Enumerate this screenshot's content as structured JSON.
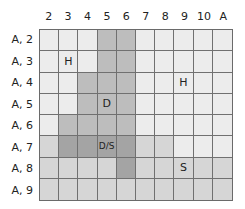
{
  "columns": [
    "2",
    "3",
    "4",
    "5",
    "6",
    "7",
    "8",
    "9",
    "10",
    "A"
  ],
  "rows": [
    "A, 2",
    "A, 3",
    "A, 4",
    "A, 5",
    "A, 6",
    "A, 7",
    "A, 8",
    "A, 9"
  ],
  "shade_levels": {
    "0": "#ececec",
    "1": "#d6d6d6",
    "2": "#bdbdbd",
    "3": "#a4a4a4"
  },
  "cells": [
    [
      0,
      0,
      0,
      2,
      2,
      0,
      0,
      0,
      0,
      0
    ],
    [
      0,
      0,
      0,
      2,
      2,
      0,
      0,
      0,
      0,
      0
    ],
    [
      0,
      0,
      2,
      2,
      2,
      0,
      0,
      0,
      0,
      0
    ],
    [
      0,
      0,
      2,
      2,
      2,
      0,
      0,
      0,
      0,
      0
    ],
    [
      0,
      2,
      2,
      2,
      2,
      0,
      0,
      0,
      0,
      0
    ],
    [
      1,
      3,
      3,
      3,
      3,
      1,
      1,
      0,
      0,
      0
    ],
    [
      1,
      1,
      1,
      1,
      3,
      1,
      1,
      1,
      1,
      1
    ],
    [
      1,
      1,
      1,
      1,
      1,
      1,
      1,
      1,
      1,
      1
    ]
  ],
  "labels": [
    {
      "row": 1,
      "col": 1,
      "text": "H"
    },
    {
      "row": 2,
      "col": 7,
      "text": "H"
    },
    {
      "row": 3,
      "col": 3,
      "text": "D"
    },
    {
      "row": 5,
      "col": 3,
      "text": "D/S"
    },
    {
      "row": 6,
      "col": 7,
      "text": "S"
    }
  ]
}
